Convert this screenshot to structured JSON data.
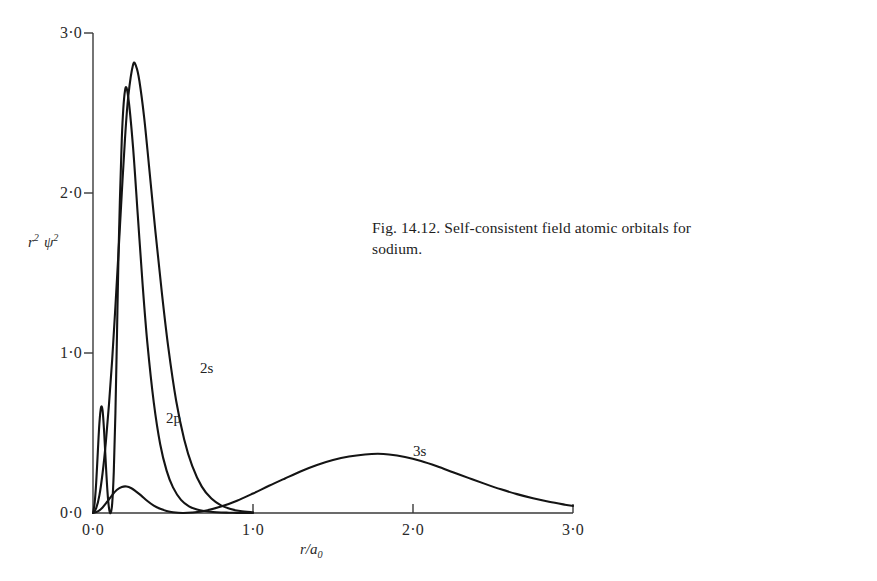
{
  "figure": {
    "caption": "Fig. 14.12.  Self-consistent field atomic orbitals for sodium.",
    "background_color": "#ffffff",
    "ink_color": "#1a1a1a"
  },
  "axes": {
    "y_title_main": "r",
    "y_title_main_sup": "2",
    "y_title_psi": "ψ",
    "y_title_psi_sup": "2",
    "x_title_main": "r/a",
    "x_title_sub": "0",
    "y_ticks": [
      "0·0",
      "1·0",
      "2·0",
      "3·0"
    ],
    "x_ticks": [
      "0·0",
      "1·0",
      "2·0",
      "3·0"
    ]
  },
  "annotations": {
    "curve_2s": "2s",
    "curve_2p": "2p",
    "curve_3s": "3s"
  },
  "chart_data": {
    "type": "line",
    "title": "Fig. 14.12.  Self-consistent field atomic orbitals for sodium.",
    "xlabel": "r/a0",
    "ylabel": "r^2 psi^2",
    "xlim": [
      0.0,
      3.0
    ],
    "ylim": [
      0.0,
      3.0
    ],
    "xticks": [
      0.0,
      1.0,
      2.0,
      3.0
    ],
    "yticks": [
      0.0,
      1.0,
      2.0,
      3.0
    ],
    "xtick_labels": [
      "0·0",
      "1·0",
      "2·0",
      "3·0"
    ],
    "ytick_labels": [
      "0·0",
      "1·0",
      "2·0",
      "3·0"
    ],
    "grid": false,
    "legend": "inline-curve-labels",
    "series": [
      {
        "name": "2s",
        "label_position": [
          0.67,
          0.96
        ],
        "x": [
          0.0,
          0.01,
          0.02,
          0.03,
          0.04,
          0.05,
          0.06,
          0.07,
          0.08,
          0.09,
          0.1,
          0.11,
          0.12,
          0.13,
          0.14,
          0.15,
          0.16,
          0.18,
          0.2,
          0.22,
          0.25,
          0.28,
          0.31,
          0.34,
          0.38,
          0.42,
          0.46,
          0.5,
          0.55,
          0.6,
          0.65,
          0.7,
          0.75,
          0.8,
          0.85,
          0.9,
          0.95,
          1.0
        ],
        "y": [
          0.0,
          0.06,
          0.19,
          0.38,
          0.56,
          0.66,
          0.64,
          0.5,
          0.31,
          0.14,
          0.03,
          0.0,
          0.06,
          0.26,
          0.62,
          1.12,
          1.64,
          2.34,
          2.64,
          2.6,
          2.29,
          1.86,
          1.43,
          1.06,
          0.69,
          0.43,
          0.265,
          0.16,
          0.082,
          0.042,
          0.022,
          0.012,
          0.006,
          0.003,
          0.002,
          0.001,
          0.0,
          0.0
        ]
      },
      {
        "name": "2p",
        "label_position": [
          0.46,
          0.64
        ],
        "x": [
          0.0,
          0.02,
          0.04,
          0.06,
          0.08,
          0.1,
          0.12,
          0.14,
          0.16,
          0.18,
          0.2,
          0.22,
          0.25,
          0.27,
          0.29,
          0.32,
          0.35,
          0.39,
          0.43,
          0.47,
          0.52,
          0.57,
          0.62,
          0.68,
          0.74,
          0.8,
          0.86,
          0.92,
          1.0
        ],
        "y": [
          0.0,
          0.03,
          0.11,
          0.25,
          0.44,
          0.68,
          0.96,
          1.29,
          1.64,
          2.0,
          2.34,
          2.6,
          2.8,
          2.79,
          2.7,
          2.47,
          2.17,
          1.76,
          1.38,
          1.04,
          0.7,
          0.46,
          0.295,
          0.165,
          0.09,
          0.048,
          0.025,
          0.012,
          0.004
        ]
      },
      {
        "name": "3s",
        "label_position": [
          2.0,
          0.49
        ],
        "x": [
          0.0,
          0.03,
          0.06,
          0.09,
          0.12,
          0.15,
          0.18,
          0.21,
          0.24,
          0.27,
          0.3,
          0.34,
          0.38,
          0.42,
          0.46,
          0.5,
          0.56,
          0.62,
          0.7,
          0.8,
          0.9,
          1.0,
          1.1,
          1.2,
          1.3,
          1.4,
          1.5,
          1.6,
          1.7,
          1.78,
          1.85,
          1.95,
          2.05,
          2.15,
          2.25,
          2.35,
          2.45,
          2.55,
          2.65,
          2.75,
          2.85,
          2.95,
          3.0
        ],
        "y": [
          0.0,
          0.01,
          0.035,
          0.072,
          0.112,
          0.145,
          0.163,
          0.166,
          0.155,
          0.134,
          0.11,
          0.075,
          0.046,
          0.026,
          0.013,
          0.005,
          0.0,
          0.003,
          0.014,
          0.04,
          0.077,
          0.122,
          0.17,
          0.216,
          0.261,
          0.3,
          0.331,
          0.353,
          0.366,
          0.37,
          0.366,
          0.35,
          0.325,
          0.292,
          0.255,
          0.218,
          0.182,
          0.148,
          0.118,
          0.092,
          0.07,
          0.052,
          0.044
        ]
      }
    ]
  },
  "plot_geometry": {
    "origin_px": [
      93,
      513
    ],
    "x_right_px": 573,
    "y_top_px": 33,
    "px_per_unit_x": 160,
    "px_per_unit_y": 160
  }
}
